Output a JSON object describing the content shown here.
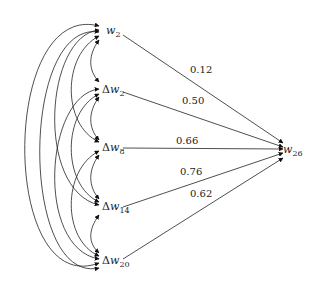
{
  "diagram": {
    "type": "directed-graph",
    "nodes": [
      {
        "id": "w2",
        "prefix": "",
        "var": "w",
        "sub": "2"
      },
      {
        "id": "dw2",
        "prefix": "Δ",
        "var": "w",
        "sub": "2"
      },
      {
        "id": "dw8",
        "prefix": "Δ",
        "var": "w",
        "sub": "8"
      },
      {
        "id": "dw14",
        "prefix": "Δ",
        "var": "w",
        "sub": "14"
      },
      {
        "id": "dw20",
        "prefix": "Δ",
        "var": "w",
        "sub": "20"
      },
      {
        "id": "w26",
        "prefix": "",
        "var": "w",
        "sub": "26"
      }
    ],
    "weighted_edges": [
      {
        "from": "w2",
        "to": "w26",
        "weight": "0.12"
      },
      {
        "from": "dw2",
        "to": "w26",
        "weight": "0.50"
      },
      {
        "from": "dw8",
        "to": "w26",
        "weight": "0.66"
      },
      {
        "from": "dw14",
        "to": "w26",
        "weight": "0.76"
      },
      {
        "from": "dw20",
        "to": "w26",
        "weight": "0.62"
      }
    ],
    "bidirectional_arcs_between_inputs": "all pairs of {w2, Δw2, Δw8, Δw14, Δw20}"
  }
}
